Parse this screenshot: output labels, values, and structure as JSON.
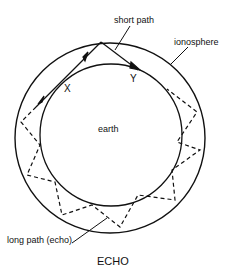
{
  "diagram": {
    "labels": {
      "short_path": "short path",
      "ionosphere": "ionosphere",
      "point_x": "X",
      "point_y": "Y",
      "earth": "earth",
      "long_path": "long path (echo)"
    },
    "caption": "ECHO",
    "colors": {
      "stroke": "#111111",
      "background": "#ffffff"
    },
    "geometry": {
      "ionosphere_circle": {
        "cx": 110,
        "cy": 138,
        "r": 95
      },
      "earth_circle": {
        "cx": 111,
        "cy": 135,
        "r": 71
      }
    }
  }
}
